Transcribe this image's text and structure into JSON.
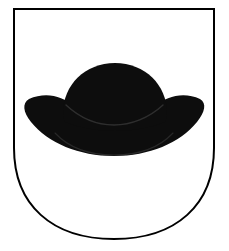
{
  "image": {
    "kind": "coat-of-arms",
    "title": "Coat of arms",
    "width": 229,
    "height": 251,
    "background_color": "#ffffff",
    "alt_text": "Heraldic shield, white field, charged with a black wide-brimmed hat"
  },
  "shield": {
    "name": "shield",
    "blazon_tincture": "Argent",
    "field_color": "#ffffff",
    "outline_color": "#000000",
    "outline_width": 2,
    "shape": "rounded-base escutcheon",
    "geometry": {
      "top_y": 9,
      "left_x": 14,
      "right_x": 214,
      "bottom_y": 239,
      "straight_side_until_y": 148
    }
  },
  "charge": {
    "name": "hat",
    "label": "hat",
    "tincture": "Sable",
    "color": "#0d0d0d",
    "detail_line_color": "#2e2e2e",
    "description": "wide-brimmed round-crowned hat",
    "geometry": {
      "crown_top_y": 63,
      "crown_left_x": 63,
      "crown_right_x": 167,
      "brim_left_x": 28,
      "brim_right_x": 201,
      "brim_bottom_y": 156,
      "brim_mid_y": 118
    }
  },
  "layers": [
    {
      "name": "shield-field",
      "label": "shield field",
      "color": "#ffffff"
    },
    {
      "name": "shield-outline",
      "label": "shield outline",
      "color": "#000000"
    },
    {
      "name": "hat-brim",
      "label": "hat brim",
      "color": "#0d0d0d"
    },
    {
      "name": "hat-crown",
      "label": "hat crown",
      "color": "#0d0d0d"
    },
    {
      "name": "hat-brim-inner-line",
      "label": "hat brim inner line",
      "color": "#2e2e2e"
    },
    {
      "name": "hat-crown-base-line",
      "label": "hat crown base line",
      "color": "#2e2e2e"
    }
  ]
}
